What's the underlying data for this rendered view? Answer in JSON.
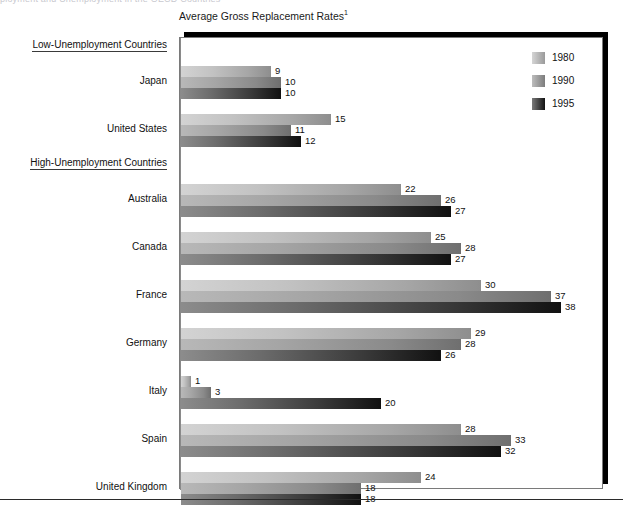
{
  "top_fragment": "ployment and Unemployment in the OECD Countries",
  "chart_title": "Average Gross Replacement Rates",
  "chart_title_footnote": "1",
  "legend": {
    "items": [
      {
        "label": "1980",
        "key": "y1980",
        "color": "#c2c2c2"
      },
      {
        "label": "1990",
        "key": "y1990",
        "color": "#a5a5a5"
      },
      {
        "label": "1995",
        "key": "y1995",
        "color": "#2a2a2a"
      }
    ]
  },
  "groups": [
    {
      "header": "Low-Unemployment Countries",
      "countries": [
        {
          "name": "Japan",
          "values": [
            9,
            10,
            10
          ]
        },
        {
          "name": "United States",
          "values": [
            15,
            11,
            12
          ]
        }
      ]
    },
    {
      "header": "High-Unemployment Countries",
      "countries": [
        {
          "name": "Australia",
          "values": [
            22,
            26,
            27
          ]
        },
        {
          "name": "Canada",
          "values": [
            25,
            28,
            27
          ]
        },
        {
          "name": "France",
          "values": [
            30,
            37,
            38
          ]
        },
        {
          "name": "Germany",
          "values": [
            29,
            28,
            26
          ]
        },
        {
          "name": "Italy",
          "values": [
            1,
            3,
            20
          ]
        },
        {
          "name": "Spain",
          "values": [
            28,
            33,
            32
          ]
        },
        {
          "name": "United Kingdom",
          "values": [
            24,
            18,
            18
          ]
        }
      ]
    }
  ],
  "chart_data": {
    "type": "bar",
    "orientation": "horizontal",
    "title": "Average Gross Replacement Rates",
    "xlabel": "",
    "ylabel": "",
    "xlim": [
      0,
      40
    ],
    "grid": false,
    "legend_position": "top-right",
    "categories": [
      "Japan",
      "United States",
      "Australia",
      "Canada",
      "France",
      "Germany",
      "Italy",
      "Spain",
      "United Kingdom"
    ],
    "category_groups": {
      "Low-Unemployment Countries": [
        "Japan",
        "United States"
      ],
      "High-Unemployment Countries": [
        "Australia",
        "Canada",
        "France",
        "Germany",
        "Italy",
        "Spain",
        "United Kingdom"
      ]
    },
    "series": [
      {
        "name": "1980",
        "values": [
          9,
          15,
          22,
          25,
          30,
          29,
          1,
          28,
          24
        ]
      },
      {
        "name": "1990",
        "values": [
          10,
          11,
          26,
          28,
          37,
          28,
          3,
          33,
          18
        ]
      },
      {
        "name": "1995",
        "values": [
          10,
          12,
          27,
          27,
          38,
          26,
          20,
          32,
          18
        ]
      }
    ]
  },
  "scale": {
    "max": 40,
    "plot_width_px": 400
  }
}
